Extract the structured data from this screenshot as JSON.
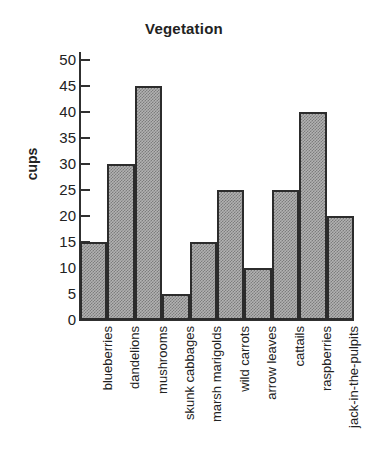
{
  "chart_data": {
    "type": "bar",
    "title": "Vegetation",
    "xlabel": "",
    "ylabel": "cups",
    "categories": [
      "blueberries",
      "dandelions",
      "mushrooms",
      "skunk cabbages",
      "marsh marigolds",
      "wild carrots",
      "arrow leaves",
      "cattails",
      "raspberries",
      "jack-in-the-pulpits"
    ],
    "values": [
      15,
      30,
      45,
      5,
      15,
      25,
      10,
      25,
      40,
      20
    ],
    "ylim": [
      0,
      50
    ],
    "ytick_values": [
      0,
      5,
      10,
      15,
      20,
      25,
      30,
      35,
      40,
      45,
      50
    ],
    "ytick_labels": [
      "0",
      "5",
      "10",
      "15",
      "20",
      "25",
      "30",
      "35",
      "40",
      "45",
      "50"
    ],
    "grid": false,
    "legend": null,
    "bar_fill": "#9a9a9a",
    "bar_edge": "#2c2c2c",
    "background": "#ffffff",
    "text_color": "#222222"
  }
}
